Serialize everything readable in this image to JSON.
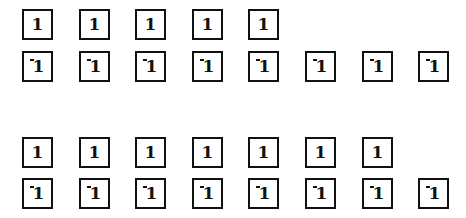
{
  "groups": [
    {
      "rows": [
        {
          "cells": [
            "1",
            "1",
            "1",
            "1",
            "1"
          ],
          "sign": "positive"
        },
        {
          "cells": [
            "1",
            "1",
            "1",
            "1",
            "1",
            "1",
            "1",
            "1"
          ],
          "sign": "negative"
        }
      ]
    },
    {
      "rows": [
        {
          "cells": [
            "1",
            "1",
            "1",
            "1",
            "1",
            "1",
            "1"
          ],
          "sign": "positive"
        },
        {
          "cells": [
            "1",
            "1",
            "1",
            "1",
            "1",
            "1",
            "1",
            "1"
          ],
          "sign": "negative"
        }
      ]
    }
  ],
  "layout": {
    "box_spacing": 56.6,
    "row_tops": [
      [
        9,
        51
      ],
      [
        137,
        178
      ]
    ]
  },
  "colors": {
    "border": "#111111",
    "background": "#ffffff",
    "text": "#111111"
  }
}
